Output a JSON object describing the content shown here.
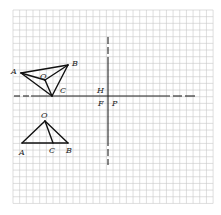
{
  "diagram": {
    "grid": {
      "x0": 13,
      "y0": 10,
      "cols": 30,
      "rows": 29,
      "cell": 6.67,
      "color": "#c8c8c8"
    },
    "axes": {
      "horizontal": {
        "y": 96,
        "x1": 14,
        "x2": 195,
        "dashed_ends": true
      },
      "vertical": {
        "x": 108,
        "y1": 37,
        "y2": 165,
        "dashed_ends": true
      }
    },
    "upper_figure": {
      "points": {
        "A": {
          "x": 21,
          "y": 73,
          "label": "A"
        },
        "B": {
          "x": 68,
          "y": 65,
          "label": "B"
        },
        "C": {
          "x": 52,
          "y": 96,
          "label": "C"
        },
        "O": {
          "x": 45,
          "y": 80,
          "label": "O"
        }
      },
      "segments": [
        [
          "A",
          "B"
        ],
        [
          "A",
          "C"
        ],
        [
          "B",
          "C"
        ],
        [
          "A",
          "O"
        ],
        [
          "O",
          "B"
        ],
        [
          "O",
          "C"
        ]
      ]
    },
    "lower_figure": {
      "points": {
        "O": {
          "x": 45,
          "y": 121,
          "label": "O"
        },
        "A": {
          "x": 22,
          "y": 143,
          "label": "A"
        },
        "C": {
          "x": 53,
          "y": 143,
          "label": "C"
        },
        "B": {
          "x": 68,
          "y": 143,
          "label": "B"
        }
      },
      "segments": [
        [
          "O",
          "A"
        ],
        [
          "O",
          "B"
        ],
        [
          "A",
          "B"
        ],
        [
          "O",
          "C"
        ]
      ]
    },
    "axis_labels": {
      "H": "H",
      "F": "F",
      "P": "P"
    },
    "labels": {
      "upper_A": "A",
      "upper_B": "B",
      "upper_C": "C",
      "upper_O": "O",
      "lower_O": "O",
      "lower_A": "A",
      "lower_C": "C",
      "lower_B": "B"
    }
  }
}
